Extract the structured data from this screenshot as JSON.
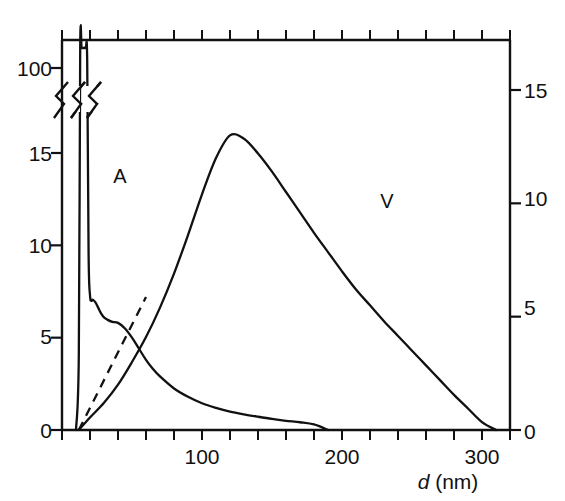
{
  "figure": {
    "background": "#ffffff",
    "line_color": "#111111"
  },
  "axes": {
    "x": {
      "title_symbol": "d",
      "title_unit": " (nm)",
      "labels": [
        "100",
        "200",
        "300"
      ],
      "label_values": [
        100,
        200,
        300
      ],
      "range": [
        0,
        320
      ],
      "tick_interval": 20,
      "minor_ticks_top": true
    },
    "y_left": {
      "labels": [
        "0",
        "5",
        "10",
        "15",
        "100"
      ],
      "label_values": [
        0,
        5,
        10,
        15,
        100
      ],
      "range_lower": [
        0,
        15
      ],
      "broken": true,
      "break_note": "axis break between 15 and 100"
    },
    "y_right": {
      "labels": [
        "0",
        "5",
        "10",
        "15"
      ],
      "label_values": [
        0,
        5,
        10,
        15
      ],
      "range": [
        0,
        16.5
      ]
    }
  },
  "curve_labels": [
    {
      "text": "A",
      "x_px": 120,
      "y_px": 176
    },
    {
      "text": "V",
      "x_px": 387,
      "y_px": 201
    }
  ],
  "chart_data": {
    "type": "line",
    "title": "",
    "xlabel": "d (nm)",
    "ylabel_left": "",
    "ylabel_right": "",
    "xlim": [
      0,
      320
    ],
    "ylim_left": [
      0,
      15
    ],
    "ylim_left_broken_top": 100,
    "ylim_right": [
      0,
      16.5
    ],
    "grid": false,
    "legend": "inline curve labels A and V",
    "series": [
      {
        "name": "A",
        "axis": "left",
        "style": "solid",
        "comment": "sharp spike above 100 near d=12-22 nm, local maximum ~7 at d=22 nm, shallow minimum ~5.8 at d=40 nm, then monotonic decay to 0 at d=190 nm",
        "x": [
          10,
          12,
          13,
          14,
          15,
          16,
          17,
          18,
          19,
          20,
          21,
          22,
          24,
          26,
          28,
          30,
          33,
          36,
          40,
          45,
          50,
          55,
          60,
          65,
          70,
          80,
          90,
          100,
          110,
          120,
          130,
          140,
          150,
          160,
          170,
          180,
          190
        ],
        "y": [
          0,
          4.0,
          40,
          103,
          115,
          108,
          60,
          20,
          9.5,
          7.3,
          7.0,
          7.05,
          6.9,
          6.6,
          6.3,
          6.1,
          5.95,
          5.85,
          5.8,
          5.5,
          5.0,
          4.4,
          3.8,
          3.3,
          2.9,
          2.25,
          1.8,
          1.45,
          1.2,
          1.0,
          0.85,
          0.72,
          0.6,
          0.5,
          0.42,
          0.3,
          0.0
        ]
      },
      {
        "name": "V",
        "axis": "right",
        "style": "solid",
        "comment": "broad asymmetric bell peaking ~13 at d=120 nm, decaying to 0 at d=310 nm",
        "x": [
          12,
          20,
          30,
          40,
          50,
          60,
          70,
          80,
          90,
          100,
          110,
          120,
          130,
          140,
          150,
          160,
          170,
          180,
          190,
          200,
          210,
          220,
          230,
          240,
          250,
          260,
          270,
          280,
          290,
          300,
          310
        ],
        "y": [
          0.0,
          0.55,
          1.2,
          2.0,
          3.0,
          4.1,
          5.4,
          6.9,
          8.6,
          10.4,
          12.0,
          13.0,
          12.85,
          12.2,
          11.4,
          10.5,
          9.6,
          8.7,
          7.85,
          7.0,
          6.2,
          5.5,
          4.8,
          4.15,
          3.5,
          2.85,
          2.2,
          1.55,
          0.95,
          0.35,
          0.0
        ]
      },
      {
        "name": "dashed-reference",
        "axis": "left",
        "style": "dashed",
        "comment": "straight dashed line from origin rising to meet the V curve",
        "x": [
          12,
          60
        ],
        "y": [
          0,
          7.2
        ]
      }
    ]
  }
}
